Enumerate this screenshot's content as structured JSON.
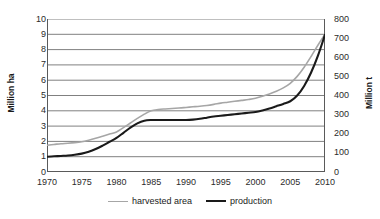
{
  "chart_data": {
    "type": "line",
    "title": "",
    "xlabel": "",
    "ylabel": "Million ha",
    "ylabel_right": "Million t",
    "x": [
      1970,
      1971,
      1972,
      1973,
      1974,
      1975,
      1976,
      1977,
      1978,
      1979,
      1980,
      1981,
      1982,
      1983,
      1984,
      1985,
      1986,
      1987,
      1988,
      1989,
      1990,
      1991,
      1992,
      1993,
      1994,
      1995,
      1996,
      1997,
      1998,
      1999,
      2000,
      2001,
      2002,
      2003,
      2004,
      2005,
      2006,
      2007,
      2008,
      2009,
      2010
    ],
    "xlim": [
      1970,
      2010
    ],
    "ylim": [
      0,
      10
    ],
    "ylim_right": [
      0,
      800
    ],
    "xticks": [
      "1970",
      "1975",
      "1980",
      "1985",
      "1990",
      "1995",
      "2000",
      "2005",
      "2010"
    ],
    "yticks_left": [
      "10",
      "9",
      "8",
      "7",
      "6",
      "5",
      "4",
      "3",
      "2",
      "1",
      "0"
    ],
    "yticks_right": [
      "800",
      "700",
      "600",
      "500",
      "400",
      "300",
      "200",
      "100",
      "0"
    ],
    "grid": true,
    "legend_position": "bottom",
    "series": [
      {
        "name": "harvested area",
        "axis": "left",
        "unit": "Million ha",
        "color": "#a6a6a6",
        "values": [
          1.75,
          1.8,
          1.85,
          1.88,
          1.92,
          1.98,
          2.08,
          2.2,
          2.34,
          2.48,
          2.62,
          2.9,
          3.2,
          3.5,
          3.78,
          4.0,
          4.08,
          4.12,
          4.15,
          4.18,
          4.22,
          4.26,
          4.3,
          4.35,
          4.42,
          4.5,
          4.56,
          4.62,
          4.68,
          4.74,
          4.82,
          4.95,
          5.1,
          5.28,
          5.5,
          5.8,
          6.25,
          6.85,
          7.55,
          8.3,
          9.0
        ]
      },
      {
        "name": "production",
        "axis": "right",
        "unit": "Million t",
        "color": "#1a1a1a",
        "values": [
          80,
          82,
          84,
          86,
          90,
          96,
          106,
          120,
          138,
          158,
          178,
          205,
          232,
          254,
          268,
          272,
          272,
          272,
          272,
          272,
          272,
          274,
          278,
          284,
          290,
          294,
          298,
          302,
          306,
          310,
          314,
          322,
          332,
          344,
          356,
          370,
          400,
          450,
          520,
          610,
          718
        ]
      }
    ]
  },
  "legend": {
    "items": [
      {
        "label": "harvested area"
      },
      {
        "label": "production"
      }
    ]
  }
}
